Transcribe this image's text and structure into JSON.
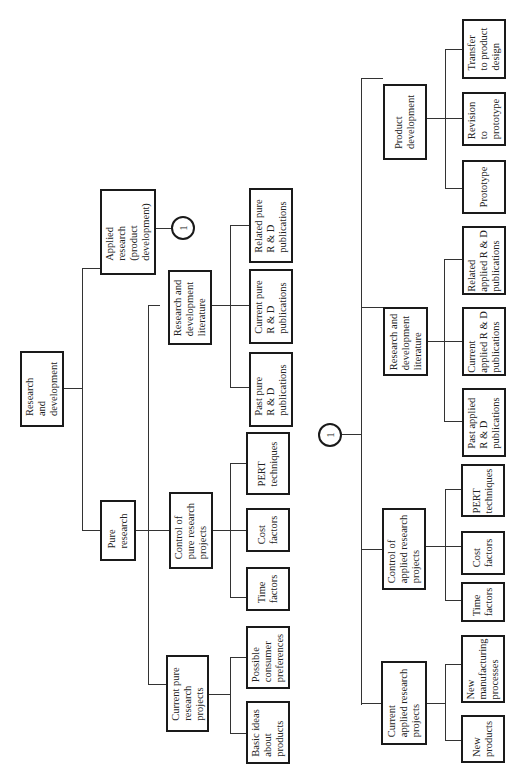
{
  "diagram": {
    "root": "Research\nand\ndevelopment",
    "pure_research": "Pure\nresearch",
    "applied_research": "Applied\nresearch\n(product\ndevelopment)",
    "connector_label": "1",
    "pure": {
      "current_projects": "Current pure\nresearch\nprojects",
      "basic_ideas": "Basic ideas\nabout\nproducts",
      "consumer_prefs": "Possible\nconsumer\npreferences",
      "control": "Control of\npure research\nprojects",
      "time": "Time\nfactors",
      "cost": "Cost\nfactors",
      "pert": "PERT\ntechniques",
      "literature": "Research and\ndevelopment\nliterature",
      "past_pubs": "Past pure\nR & D\npublications",
      "current_pubs": "Current pure\nR & D\npublications",
      "related_pubs": "Related pure\nR & D\npublications"
    },
    "applied": {
      "current_projects": "Current\napplied research\nprojects",
      "new_products": "New\nproducts",
      "new_manufacturing": "New\nmanufacturing\nprocesses",
      "control": "Control of\napplied research\nprojects",
      "time": "Time\nfactors",
      "cost": "Cost\nfactors",
      "pert": "PERT\ntechniques",
      "literature": "Research and\ndevelopment\nliterature",
      "past_pubs": "Past applied\nR & D\npublications",
      "current_pubs": "Current\napplied R & D\npublications",
      "related_pubs": "Related\napplied R & D\npublications",
      "product_dev": "Product\ndevelopment",
      "prototype": "Prototype",
      "revision": "Revision\nto\nprototype",
      "transfer": "Transfer\nto product\ndesign"
    }
  }
}
